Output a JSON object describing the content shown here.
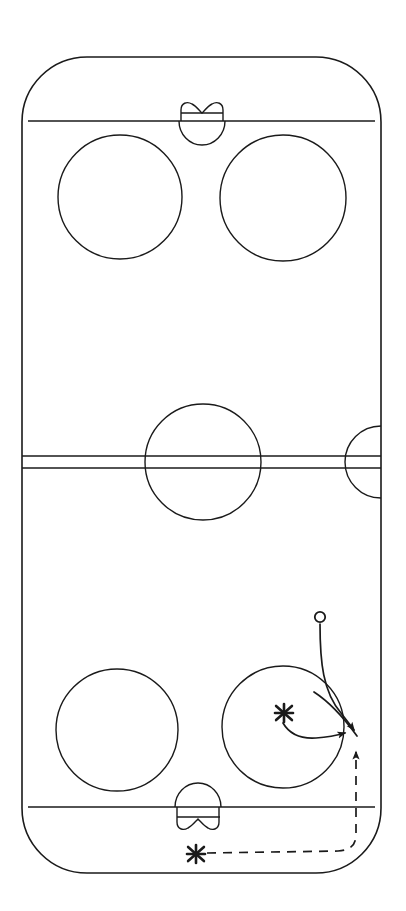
{
  "document": {
    "title": "Ice Hockey Rink Play Diagram",
    "type": "sports-play-diagram",
    "sport": "ice hockey",
    "background_color": "#ffffff",
    "line_color": "#1a1a1a",
    "orientation": "vertical"
  },
  "canvas": {
    "width": 406,
    "height": 911
  },
  "rink": {
    "name": "full-ice-rink-outline",
    "left": 22,
    "right": 381,
    "top": 57,
    "bottom": 873,
    "corner_radius": 65,
    "stroke_width": 1.6
  },
  "lines": {
    "goal_line_top": {
      "label": "goal-line-top",
      "y": 121,
      "x_start": 28,
      "x_end": 375
    },
    "goal_line_bottom": {
      "label": "goal-line-bottom",
      "y": 807,
      "x_start": 28,
      "x_end": 375
    },
    "center_line_upper": {
      "label": "center-red-line-upper-edge",
      "y": 456,
      "x_start": 22,
      "x_end": 381
    },
    "center_line_lower": {
      "label": "center-red-line-lower-edge",
      "y": 468,
      "x_start": 22,
      "x_end": 381
    }
  },
  "center_circle": {
    "label": "center-faceoff-circle",
    "cx": 203,
    "cy": 462,
    "r": 58
  },
  "referee_crease": {
    "label": "referee-crease-semicircle",
    "cx": 381,
    "cy": 462,
    "r": 36
  },
  "faceoff_circles": [
    {
      "label": "faceoff-circle-top-left",
      "cx": 120,
      "cy": 197,
      "r": 62
    },
    {
      "label": "faceoff-circle-top-right",
      "cx": 283,
      "cy": 198,
      "r": 63
    },
    {
      "label": "faceoff-circle-bottom-left",
      "cx": 117,
      "cy": 730,
      "r": 61
    },
    {
      "label": "faceoff-circle-bottom-right",
      "cx": 283,
      "cy": 727,
      "r": 61
    }
  ],
  "goals": [
    {
      "label": "goal-top",
      "crease_direction": "down",
      "crease_cx": 202,
      "crease_cy": 121,
      "crease_rx": 23,
      "crease_ry": 24,
      "net_left": 180,
      "net_right": 224,
      "net_top": 103,
      "net_bottom": 121,
      "net_bar_y": 113
    },
    {
      "label": "goal-bottom",
      "crease_direction": "up",
      "crease_cx": 198,
      "crease_cy": 807,
      "crease_rx": 23,
      "crease_ry": 24,
      "net_left": 177,
      "net_right": 220,
      "net_top": 807,
      "net_bottom": 831,
      "net_bar_y": 817
    }
  ],
  "play": {
    "label": "offensive-zone-play",
    "markers": [
      {
        "id": "o1",
        "symbol": "O",
        "name": "player-marker-o",
        "cx": 320,
        "cy": 617,
        "r": 5.2
      },
      {
        "id": "x1",
        "symbol": "X",
        "name": "player-marker-x-slot",
        "cx": 284,
        "cy": 713,
        "size": 9
      },
      {
        "id": "x2",
        "symbol": "X",
        "name": "player-marker-x-behind-net",
        "cx": 196,
        "cy": 854,
        "size": 9
      }
    ],
    "paths": [
      {
        "id": "path-o-skate",
        "name": "skating-path-o-player",
        "style": "solid",
        "arrow": true,
        "d": "M 320 624 C 320 660 322 690 340 712 C 348 722 353 728 356 733"
      },
      {
        "id": "path-o-return",
        "name": "curve-loop-o-player",
        "style": "solid",
        "arrow": false,
        "d": "M 356 733 C 342 716 326 700 313 691"
      },
      {
        "id": "path-x-pass",
        "name": "pass-path-x-slot",
        "style": "solid",
        "arrow": true,
        "d": "M 284 722 C 290 733 300 737 315 736 C 330 735 340 733 348 731"
      },
      {
        "id": "path-x-behind-net",
        "name": "dashed-skating-path-x-behind-net",
        "style": "dashed",
        "arrow": true,
        "d": "M 207 853 L 340 851 C 352 850 356 845 356 835 L 356 748"
      }
    ],
    "arrowheads": [
      {
        "for": "path-o-skate",
        "x": 356,
        "y": 733,
        "angle": 58
      },
      {
        "for": "path-x-pass",
        "x": 352,
        "y": 731,
        "angle": 0
      },
      {
        "for": "path-x-behind-net",
        "x": 356,
        "y": 746,
        "angle": -90
      }
    ]
  },
  "legend": {
    "o_meaning": "O",
    "x_meaning": "X",
    "solid_line_meaning": "solid arrow",
    "dashed_line_meaning": "dashed arrow"
  }
}
